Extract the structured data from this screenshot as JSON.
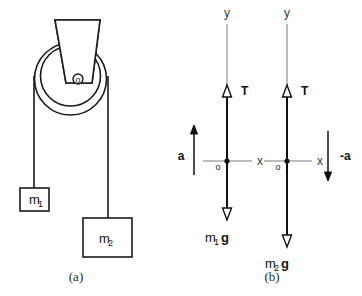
{
  "figure": {
    "background_color": "#ffffff",
    "line_color": "#1a1a1a",
    "axis_color": "#7a7a7a",
    "vector_color": "#111111"
  },
  "panel_a": {
    "caption": "(a)",
    "pulley": {
      "hub_label": "o",
      "bracket_name": "ceiling-bracket"
    },
    "masses": [
      {
        "label": "m",
        "subscript": "1",
        "name": "mass-block-m1"
      },
      {
        "label": "m",
        "subscript": "2",
        "name": "mass-block-m2"
      }
    ]
  },
  "panel_b": {
    "caption": "(b)",
    "diagrams": [
      {
        "name": "free-body-diagram-m1",
        "y_axis_label": "y",
        "x_axis_label": "x",
        "origin_label": "o",
        "tension_label": "T",
        "weight_label": "m",
        "weight_subscript": "1",
        "weight_gravity": "g",
        "acceleration_label": "a",
        "acceleration_direction": "up"
      },
      {
        "name": "free-body-diagram-m2",
        "y_axis_label": "y",
        "x_axis_label": "x",
        "origin_label": "o",
        "tension_label": "T",
        "weight_label": "m",
        "weight_subscript": "2",
        "weight_gravity": "g",
        "acceleration_label": "-a",
        "acceleration_direction": "down"
      }
    ]
  }
}
